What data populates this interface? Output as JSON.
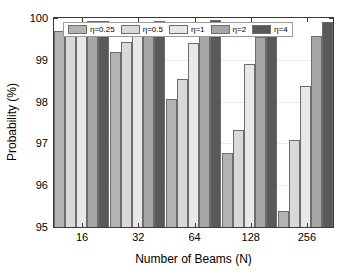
{
  "chart_data": {
    "type": "bar",
    "title": "",
    "xlabel": "Number of Beams (N)",
    "ylabel": "Probability (%)",
    "categories": [
      "16",
      "32",
      "64",
      "128",
      "256"
    ],
    "ylim": [
      95,
      100
    ],
    "yticks": [
      "95",
      "96",
      "97",
      "98",
      "99",
      "100"
    ],
    "grid": true,
    "legend_position": "top-center",
    "series": [
      {
        "name": "η=0.25",
        "color": "#b3b3b3",
        "values": [
          99.68,
          99.19,
          98.06,
          96.77,
          95.38
        ]
      },
      {
        "name": "η=0.5",
        "color": "#d9d9d9",
        "values": [
          99.76,
          99.42,
          98.55,
          97.33,
          97.08
        ]
      },
      {
        "name": "η=1",
        "color": "#e8e8e8",
        "values": [
          99.89,
          99.72,
          99.4,
          98.91,
          98.37
        ]
      },
      {
        "name": "η=2",
        "color": "#a6a6a6",
        "values": [
          99.94,
          99.88,
          99.78,
          99.55,
          99.58
        ]
      },
      {
        "name": "η=4",
        "color": "#595959",
        "values": [
          99.94,
          99.94,
          99.95,
          99.89,
          99.91
        ]
      }
    ]
  }
}
